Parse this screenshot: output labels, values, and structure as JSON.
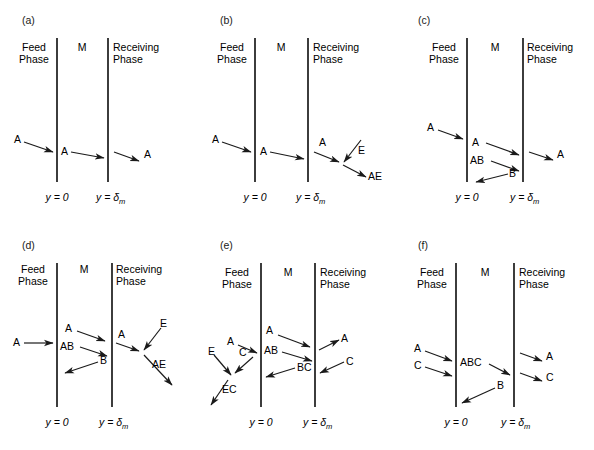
{
  "figure": {
    "panel_count": 6,
    "region_labels": {
      "feed": "Feed",
      "feed2": "Phase",
      "membrane": "M",
      "receiving": "Receiving",
      "receiving2": "Phase"
    },
    "axis_left": "y = 0",
    "axis_right_base": "y = ",
    "axis_right_sym": "δ",
    "axis_right_sub": "m",
    "line_color": "#1a1a1a"
  },
  "chart_data": {
    "type": "diagram",
    "title": "",
    "panels": [
      {
        "id": "a",
        "label": "(a)",
        "mechanism": "simple permeation",
        "species": [
          "A"
        ],
        "arrows": [
          {
            "from": "feed",
            "to": "membrane-left",
            "label": "A"
          },
          {
            "from": "membrane-left",
            "to": "membrane-right",
            "label": "A"
          },
          {
            "from": "membrane-right",
            "to": "receiving",
            "label": "A"
          }
        ]
      },
      {
        "id": "b",
        "label": "(b)",
        "mechanism": "permeation with receiving-phase reaction",
        "species": [
          "A",
          "E",
          "AE"
        ],
        "arrows": [
          {
            "from": "feed",
            "to": "membrane-left",
            "label": "A"
          },
          {
            "from": "membrane-left",
            "to": "membrane-right",
            "label": "A"
          },
          {
            "from": "membrane-right",
            "to": "receiving",
            "label": "A"
          },
          {
            "from": "receiving",
            "to": "junction",
            "label": "E"
          },
          {
            "from": "junction",
            "to": "receiving",
            "label": "AE"
          }
        ]
      },
      {
        "id": "c",
        "label": "(c)",
        "mechanism": "carrier-facilitated transport",
        "species": [
          "A",
          "AB",
          "B"
        ],
        "arrows": [
          {
            "from": "feed",
            "to": "membrane-left",
            "label": "A"
          },
          {
            "from": "membrane-left",
            "to": "membrane-right",
            "label": "A"
          },
          {
            "from": "membrane-left",
            "to": "membrane-right",
            "label": "AB"
          },
          {
            "from": "membrane-right",
            "to": "membrane-left",
            "label": "B"
          },
          {
            "from": "membrane-right",
            "to": "receiving",
            "label": "A"
          }
        ]
      },
      {
        "id": "d",
        "label": "(d)",
        "mechanism": "carrier-facilitated transport with receiving-phase reaction",
        "species": [
          "A",
          "AB",
          "B",
          "E",
          "AE"
        ],
        "arrows": [
          {
            "from": "feed",
            "to": "membrane-left",
            "label": "A"
          },
          {
            "from": "membrane-left",
            "to": "membrane-right",
            "label": "A"
          },
          {
            "from": "membrane-left",
            "to": "membrane-right",
            "label": "AB"
          },
          {
            "from": "membrane-right",
            "to": "membrane-left",
            "label": "B"
          },
          {
            "from": "membrane-right",
            "to": "junction",
            "label": "A"
          },
          {
            "from": "receiving",
            "to": "junction",
            "label": "E"
          },
          {
            "from": "junction",
            "to": "receiving",
            "label": "AE"
          }
        ]
      },
      {
        "id": "e",
        "label": "(e)",
        "mechanism": "coupled counter-transport with feed-phase reaction",
        "species": [
          "A",
          "AB",
          "BC",
          "C",
          "E",
          "EC"
        ],
        "arrows": [
          {
            "from": "feed",
            "to": "membrane-left",
            "label": "A"
          },
          {
            "from": "membrane-left",
            "to": "membrane-right",
            "label": "A"
          },
          {
            "from": "membrane-left",
            "to": "membrane-right",
            "label": "AB"
          },
          {
            "from": "membrane-right",
            "to": "membrane-left",
            "label": "BC"
          },
          {
            "from": "membrane-right",
            "to": "receiving",
            "label": "A"
          },
          {
            "from": "receiving",
            "to": "membrane-right",
            "label": "C"
          },
          {
            "from": "junction",
            "to": "feed",
            "label": "C"
          },
          {
            "from": "feed",
            "to": "junction",
            "label": "E"
          },
          {
            "from": "junction",
            "to": "feed",
            "label": "EC"
          }
        ]
      },
      {
        "id": "f",
        "label": "(f)",
        "mechanism": "co-transport of A and C with carrier B",
        "species": [
          "A",
          "C",
          "ABC",
          "B"
        ],
        "arrows": [
          {
            "from": "feed",
            "to": "membrane-left",
            "label": "A"
          },
          {
            "from": "feed",
            "to": "membrane-left",
            "label": "C"
          },
          {
            "from": "membrane-left",
            "to": "membrane-right",
            "label": "ABC"
          },
          {
            "from": "membrane-right",
            "to": "membrane-left",
            "label": "B"
          },
          {
            "from": "membrane-right",
            "to": "receiving",
            "label": "A"
          },
          {
            "from": "membrane-right",
            "to": "receiving",
            "label": "C"
          }
        ]
      }
    ]
  }
}
